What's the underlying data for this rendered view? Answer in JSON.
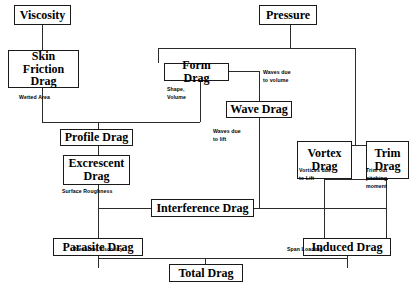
{
  "diagram": {
    "nodes": [
      {
        "id": "viscosity",
        "label": "Viscosity"
      },
      {
        "id": "pressure",
        "label": "Pressure"
      },
      {
        "id": "skin-friction-drag",
        "label": "Skin Friction\nDrag"
      },
      {
        "id": "form-drag",
        "label": "Form Drag"
      },
      {
        "id": "wave-drag",
        "label": "Wave Drag"
      },
      {
        "id": "vortex-drag",
        "label": "Vortex\nDrag"
      },
      {
        "id": "trim-drag",
        "label": "Trim\nDrag"
      },
      {
        "id": "profile-drag",
        "label": "Profile Drag"
      },
      {
        "id": "excrescent-drag",
        "label": "Excrescent\nDrag"
      },
      {
        "id": "interference-drag",
        "label": "Interference Drag"
      },
      {
        "id": "parasite-drag",
        "label": "Parasite Drag"
      },
      {
        "id": "induced-drag",
        "label": "Induced Drag"
      },
      {
        "id": "total-drag",
        "label": "Total Drag"
      }
    ],
    "notes": [
      {
        "id": "wetted-area",
        "text": "Wetted    Area"
      },
      {
        "id": "shape-volume",
        "text": "Shape,\nVolume"
      },
      {
        "id": "waves-due-to-volume",
        "text": "Waves due\nto volume"
      },
      {
        "id": "waves-due-to-lift",
        "text": "Waves due\nto lift"
      },
      {
        "id": "vortices-due-to-lift",
        "text": "Vortices due\nto Lift"
      },
      {
        "id": "trim-out-pitching-moment",
        "text": "Trim out\npitching\nmoment"
      },
      {
        "id": "surface-roughness",
        "text": "Surface   Roughness"
      },
      {
        "id": "pressure-viscosity",
        "text": "Pressure, Viscosity"
      },
      {
        "id": "span-loading",
        "text": "Span Loading"
      }
    ],
    "colors": {
      "line": "#2b2b2b",
      "box_border": "#1a1a1a",
      "text": "#000000",
      "background": "#ffffff"
    }
  }
}
